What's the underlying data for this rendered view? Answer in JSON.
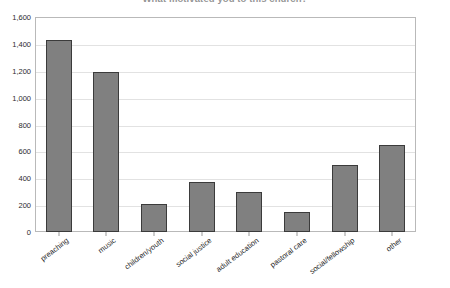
{
  "chart_data": {
    "type": "bar",
    "title": "What motivated you to this church?",
    "xlabel": "",
    "ylabel": "",
    "categories": [
      "preaching",
      "music",
      "children/youth",
      "social justice",
      "adult education",
      "pastoral care",
      "social/fellowship",
      "other"
    ],
    "values": [
      1430,
      1190,
      205,
      375,
      295,
      150,
      500,
      650
    ],
    "ylim": [
      0,
      1600
    ],
    "ytick_values": [
      0,
      200,
      400,
      600,
      800,
      1000,
      1200,
      1400,
      1600
    ],
    "ytick_labels": [
      "0",
      "200",
      "400",
      "600",
      "800",
      "1,000",
      "1,200",
      "1,400",
      "1,600"
    ],
    "grid": true,
    "legend": false,
    "bar_color": "#808080",
    "bar_edge_color": "#3b3b3b",
    "gridline_color": "#e2e2e2",
    "plot_border_color": "#b9b9b9"
  }
}
